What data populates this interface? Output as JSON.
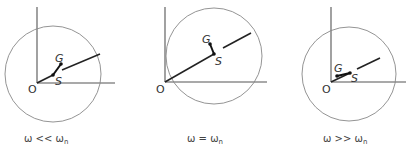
{
  "panels": [
    {
      "id": "low",
      "caption": {
        "omega": "ω",
        "relation": " << ",
        "omega_n": "ω",
        "sub": "n"
      },
      "origin": [
        37,
        83
      ],
      "axis_v_top": 7,
      "axis_h_right": 115,
      "circle": {
        "cx": 53,
        "cy": 74,
        "r": 48
      },
      "shaft_end": [
        100,
        54
      ],
      "shaft_gap": [
        [
          53,
          75
        ],
        [
          62,
          70
        ]
      ],
      "S": [
        53,
        75
      ],
      "G": [
        61,
        64
      ],
      "labels": {
        "O": "O",
        "G": "G",
        "S": "S"
      },
      "label_pos": {
        "O": [
          28,
          93
        ],
        "G": [
          55,
          62
        ],
        "S": [
          55,
          85
        ]
      }
    },
    {
      "id": "resonance",
      "caption": {
        "omega": "ω",
        "relation": " = ",
        "omega_n": "ω",
        "sub": "n"
      },
      "origin": [
        165,
        82
      ],
      "axis_v_top": 7,
      "axis_h_right": 267,
      "circle": {
        "cx": 214,
        "cy": 56,
        "r": 48
      },
      "shaft_end": [
        251,
        33
      ],
      "shaft_gap": [
        [
          214,
          54
        ],
        [
          223,
          48
        ]
      ],
      "S": [
        214,
        54
      ],
      "G": [
        210,
        44
      ],
      "labels": {
        "O": "O",
        "G": "G",
        "S": "S"
      },
      "label_pos": {
        "O": [
          156,
          93
        ],
        "G": [
          202,
          43
        ],
        "S": [
          215,
          65
        ]
      }
    },
    {
      "id": "high",
      "caption": {
        "omega": "ω",
        "relation": " >> ",
        "omega_n": "ω",
        "sub": "n"
      },
      "origin": [
        331,
        82
      ],
      "axis_v_top": 7,
      "axis_h_right": 406,
      "circle": {
        "cx": 349,
        "cy": 74,
        "r": 47
      },
      "shaft_end": [
        380,
        58
      ],
      "shaft_gap": [
        [
          350,
          73
        ],
        [
          357,
          69
        ]
      ],
      "S": [
        350,
        73
      ],
      "G": [
        337,
        76
      ],
      "labels": {
        "O": "O",
        "G": "G",
        "S": "S"
      },
      "label_pos": {
        "O": [
          322,
          93
        ],
        "G": [
          334,
          72
        ],
        "S": [
          351,
          82
        ]
      }
    }
  ],
  "captions_y": 142,
  "captions_x": [
    24,
    187,
    323
  ],
  "colors": {
    "axis": "#555555",
    "circle": "#888888",
    "shaft": "#222222",
    "text": "#333333"
  }
}
